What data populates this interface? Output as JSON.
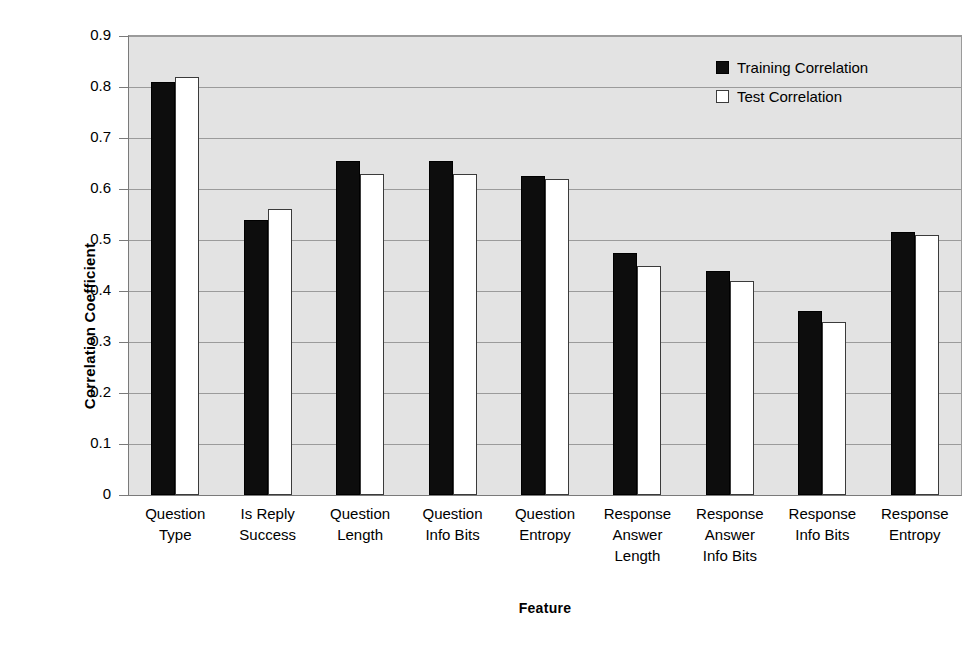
{
  "chart_data": {
    "type": "bar",
    "title": "",
    "xlabel": "Feature",
    "ylabel": "Correlation Coefficient",
    "ylim": [
      0,
      0.9
    ],
    "ytick_step": 0.1,
    "grid": true,
    "legend_position": "top-right",
    "categories": [
      "Question Type",
      "Is Reply Success",
      "Question Length",
      "Question Info Bits",
      "Question Entropy",
      "Response Answer Length",
      "Response Answer Info Bits",
      "Response Info Bits",
      "Response Entropy"
    ],
    "category_lines": [
      [
        "Question",
        "Type"
      ],
      [
        "Is Reply",
        "Success"
      ],
      [
        "Question",
        "Length"
      ],
      [
        "Question",
        "Info Bits"
      ],
      [
        "Question",
        "Entropy"
      ],
      [
        "Response",
        "Answer",
        "Length"
      ],
      [
        "Response",
        "Answer",
        "Info Bits"
      ],
      [
        "Response",
        "Info Bits"
      ],
      [
        "Response",
        "Entropy"
      ]
    ],
    "ytick_labels": [
      "0.9",
      "0.8",
      "0.7",
      "0.6",
      "0.5",
      "0.4",
      "0.3",
      "0.2",
      "0.1",
      "0"
    ],
    "ytick_values": [
      0.9,
      0.8,
      0.7,
      0.6,
      0.5,
      0.4,
      0.3,
      0.2,
      0.1,
      0
    ],
    "series": [
      {
        "name": "Training Correlation",
        "color": "#0d0d0d",
        "values": [
          0.81,
          0.54,
          0.655,
          0.655,
          0.625,
          0.475,
          0.44,
          0.36,
          0.515
        ]
      },
      {
        "name": "Test Correlation",
        "color": "#ffffff",
        "values": [
          0.82,
          0.56,
          0.63,
          0.63,
          0.62,
          0.45,
          0.42,
          0.34,
          0.51
        ]
      }
    ]
  },
  "legend": {
    "items": [
      {
        "label": "Training Correlation",
        "swatch": "filled-black-square"
      },
      {
        "label": "Test Correlation",
        "swatch": "hollow-white-square"
      }
    ]
  },
  "colors": {
    "plot_background": "#e3e3e3",
    "gridline": "#9b9b9b",
    "axis": "#7a7a7a",
    "training_bar": "#0d0d0d",
    "test_bar": "#ffffff"
  }
}
